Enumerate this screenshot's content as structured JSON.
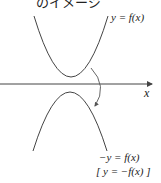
{
  "title": "のイメージ",
  "labels": {
    "upper_curve": "y = f(x)",
    "x_axis": "x",
    "lower_curve_line1": "−y = f(x)",
    "lower_curve_line2": "[ y = −f(x) ]"
  },
  "colors": {
    "stroke": "#444444",
    "text": "#222222",
    "background": "#ffffff"
  }
}
